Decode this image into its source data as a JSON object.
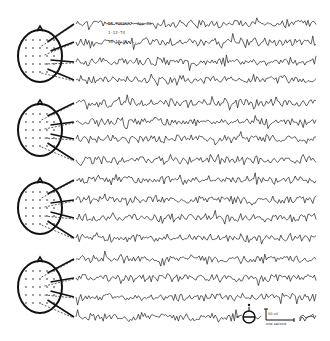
{
  "figure": {
    "type": "eeg-montage",
    "groups": [
      {
        "name": "montage-1",
        "channel_rows_y": [
          24,
          42,
          62,
          80
        ],
        "head_center": [
          40,
          56
        ]
      },
      {
        "name": "montage-2",
        "channel_rows_y": [
          103,
          122,
          139,
          160
        ],
        "head_center": [
          40,
          130
        ]
      },
      {
        "name": "montage-3",
        "channel_rows_y": [
          180,
          200,
          218,
          238
        ],
        "head_center": [
          40,
          208
        ]
      },
      {
        "name": "montage-4",
        "channel_rows_y": [
          259,
          278,
          297,
          317
        ],
        "head_center": [
          40,
          287
        ]
      }
    ],
    "header_annotation": {
      "line1": "BB 7080697  Age 79",
      "line2": "1-12-74",
      "line3": "10:18:10  ...."
    },
    "scale_bar": {
      "amplitude_label": "50 uV",
      "time_label": "one second"
    },
    "stimulus_marker": "eye-stimulus-icon"
  }
}
